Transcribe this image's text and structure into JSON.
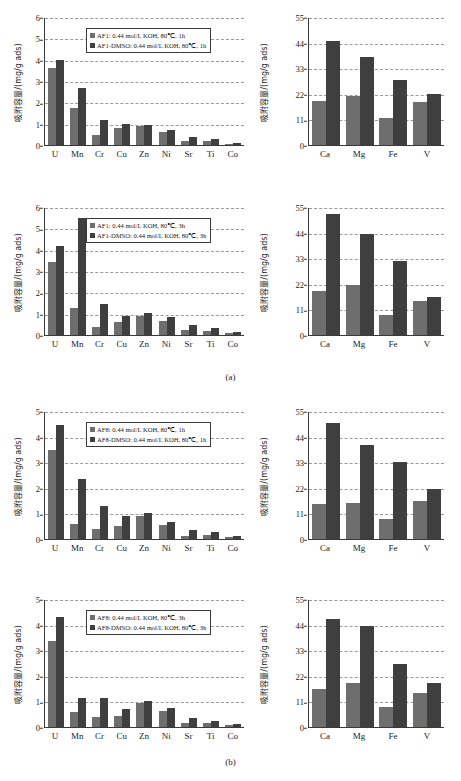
{
  "figure": {
    "subcaptions": [
      {
        "label": "(a)",
        "top": 372
      },
      {
        "label": "(b)",
        "top": 757
      }
    ],
    "colors": {
      "series1": "#6e6e6e",
      "series2": "#3f3f3f",
      "axis": "#3a3a3a",
      "grid": "#9a9a9a"
    },
    "ylabel": "吸附容量/(mg/g ads)"
  },
  "chart_data": [
    {
      "id": "af1-1h-trace",
      "type": "bar",
      "title": "",
      "xlabel": "",
      "ylabel": "吸附容量/(mg/g ads)",
      "ylim": [
        0,
        6
      ],
      "yticks": [
        0,
        1,
        2,
        3,
        4,
        5,
        6
      ],
      "grid": true,
      "legend_position": "top-center",
      "categories": [
        "U",
        "Mn",
        "Cr",
        "Cu",
        "Zn",
        "Ni",
        "Sr",
        "Ti",
        "Co"
      ],
      "series": [
        {
          "name": "AF1: 0.44 mol/L KOH, 80℃, 1h",
          "values": [
            3.6,
            1.72,
            0.45,
            0.82,
            0.87,
            0.6,
            0.18,
            0.2,
            0.07
          ]
        },
        {
          "name": "AF1-DMSO: 0.44 mol/L KOH, 80℃, 1h",
          "values": [
            4.0,
            2.68,
            1.15,
            0.97,
            0.94,
            0.7,
            0.38,
            0.28,
            0.1
          ]
        }
      ]
    },
    {
      "id": "af1-1h-major",
      "type": "bar",
      "title": "",
      "xlabel": "",
      "ylabel": "吸附容量/(mg/g ads)",
      "ylim": [
        0,
        55
      ],
      "yticks": [
        0,
        11,
        22,
        33,
        44,
        55
      ],
      "grid": true,
      "legend_position": "none",
      "categories": [
        "Ca",
        "Mg",
        "Fe",
        "V"
      ],
      "series": [
        {
          "name": "AF1: 0.44 mol/L KOH, 80℃, 1h",
          "values": [
            19.0,
            21.0,
            11.5,
            18.5
          ]
        },
        {
          "name": "AF1-DMSO: 0.44 mol/L KOH, 80℃, 1h",
          "values": [
            44.5,
            38.0,
            28.0,
            22.0
          ]
        }
      ]
    },
    {
      "id": "af1-3h-trace",
      "type": "bar",
      "title": "",
      "xlabel": "",
      "ylabel": "吸附容量/(mg/g ads)",
      "ylim": [
        0,
        6
      ],
      "yticks": [
        0,
        1,
        2,
        3,
        4,
        5,
        6
      ],
      "grid": true,
      "legend_position": "top-center",
      "categories": [
        "U",
        "Mn",
        "Cr",
        "Cu",
        "Zn",
        "Ni",
        "Sr",
        "Ti",
        "Co"
      ],
      "series": [
        {
          "name": "AF1: 0.44 mol/L KOH, 80℃, 3h",
          "values": [
            3.4,
            1.25,
            0.38,
            0.62,
            0.9,
            0.67,
            0.22,
            0.17,
            0.08
          ]
        },
        {
          "name": "AF1-DMSO: 0.44 mol/L KOH, 80℃, 3h",
          "values": [
            4.18,
            5.48,
            1.45,
            0.88,
            1.05,
            0.85,
            0.48,
            0.33,
            0.12
          ]
        }
      ]
    },
    {
      "id": "af1-3h-major",
      "type": "bar",
      "title": "",
      "xlabel": "",
      "ylabel": "吸附容量/(mg/g ads)",
      "ylim": [
        0,
        55
      ],
      "yticks": [
        0,
        11,
        22,
        33,
        44,
        55
      ],
      "grid": true,
      "legend_position": "none",
      "categories": [
        "Ca",
        "Mg",
        "Fe",
        "V"
      ],
      "series": [
        {
          "name": "AF1: 0.44 mol/L KOH, 80℃, 3h",
          "values": [
            19.0,
            21.5,
            8.5,
            14.5
          ]
        },
        {
          "name": "AF1-DMSO: 0.44 mol/L KOH, 80℃, 3h",
          "values": [
            52.0,
            43.5,
            32.0,
            16.5
          ]
        }
      ]
    },
    {
      "id": "af8-1h-trace",
      "type": "bar",
      "title": "",
      "xlabel": "",
      "ylabel": "吸附容量/(mg/g ads)",
      "ylim": [
        0,
        5
      ],
      "yticks": [
        0,
        1,
        2,
        3,
        4,
        5
      ],
      "grid": true,
      "legend_position": "top-center",
      "categories": [
        "U",
        "Mn",
        "Cr",
        "Cu",
        "Zn",
        "Ni",
        "Sr",
        "Ti",
        "Co"
      ],
      "series": [
        {
          "name": "AF8: 0.44 mol/L KOH, 80℃, 1h",
          "values": [
            3.47,
            0.6,
            0.4,
            0.5,
            0.9,
            0.53,
            0.1,
            0.17,
            0.07
          ]
        },
        {
          "name": "AF8-DMSO: 0.44 mol/L KOH, 80℃, 1h",
          "values": [
            4.47,
            2.33,
            1.3,
            0.9,
            1.0,
            0.67,
            0.35,
            0.28,
            0.1
          ]
        }
      ]
    },
    {
      "id": "af8-1h-major",
      "type": "bar",
      "title": "",
      "xlabel": "",
      "ylabel": "吸附容量/(mg/g ads)",
      "ylim": [
        0,
        55
      ],
      "yticks": [
        0,
        11,
        22,
        33,
        44,
        55
      ],
      "grid": true,
      "legend_position": "none",
      "categories": [
        "Ca",
        "Mg",
        "Fe",
        "V"
      ],
      "series": [
        {
          "name": "AF8: 0.44 mol/L KOH, 80℃, 1h",
          "values": [
            15.0,
            15.5,
            8.5,
            16.5
          ]
        },
        {
          "name": "AF8-DMSO: 0.44 mol/L KOH, 80℃, 1h",
          "values": [
            50.0,
            40.5,
            33.0,
            21.5
          ]
        }
      ]
    },
    {
      "id": "af8-3h-trace",
      "type": "bar",
      "title": "",
      "xlabel": "",
      "ylabel": "吸附容量/(mg/g ads)",
      "ylim": [
        0,
        5
      ],
      "yticks": [
        0,
        1,
        2,
        3,
        4,
        5
      ],
      "grid": true,
      "legend_position": "top-center",
      "categories": [
        "U",
        "Mn",
        "Cr",
        "Cu",
        "Zn",
        "Ni",
        "Sr",
        "Ti",
        "Co"
      ],
      "series": [
        {
          "name": "AF8: 0.44 mol/L KOH, 80℃, 3h",
          "values": [
            3.35,
            0.6,
            0.4,
            0.42,
            0.95,
            0.63,
            0.15,
            0.15,
            0.08
          ]
        },
        {
          "name": "AF8-DMSO: 0.44 mol/L KOH, 80℃, 3h",
          "values": [
            4.3,
            1.13,
            1.15,
            0.72,
            1.0,
            0.75,
            0.35,
            0.23,
            0.1
          ]
        }
      ]
    },
    {
      "id": "af8-3h-major",
      "type": "bar",
      "title": "",
      "xlabel": "",
      "ylabel": "吸附容量/(mg/g ads)",
      "ylim": [
        0,
        55
      ],
      "yticks": [
        0,
        11,
        22,
        33,
        44,
        55
      ],
      "grid": true,
      "legend_position": "none",
      "categories": [
        "Ca",
        "Mg",
        "Fe",
        "V"
      ],
      "series": [
        {
          "name": "AF8: 0.44 mol/L KOH, 80℃, 3h",
          "values": [
            16.5,
            19.0,
            8.5,
            14.5
          ]
        },
        {
          "name": "AF8-DMSO: 0.44 mol/L KOH, 80℃, 3h",
          "values": [
            46.5,
            43.5,
            27.0,
            19.0
          ]
        }
      ]
    }
  ]
}
